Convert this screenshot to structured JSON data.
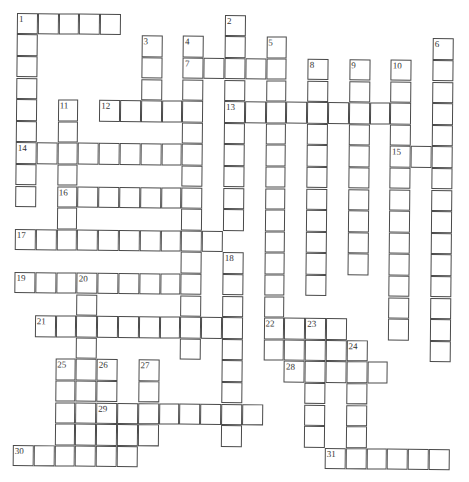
{
  "puzzle": {
    "type": "crossword",
    "grid": {
      "rows": 21,
      "cols": 22
    },
    "across": [
      {
        "number": "1",
        "row": 0,
        "col": 0,
        "length": 5
      },
      {
        "number": "7",
        "row": 2,
        "col": 8,
        "length": 5
      },
      {
        "number": "12",
        "row": 4,
        "col": 4,
        "length": 5
      },
      {
        "number": "13",
        "row": 4,
        "col": 10,
        "length": 9
      },
      {
        "number": "14",
        "row": 6,
        "col": 0,
        "length": 9
      },
      {
        "number": "15",
        "row": 6,
        "col": 18,
        "length": 3
      },
      {
        "number": "16",
        "row": 8,
        "col": 2,
        "length": 7
      },
      {
        "number": "17",
        "row": 10,
        "col": 0,
        "length": 10
      },
      {
        "number": "19",
        "row": 12,
        "col": 0,
        "length": 9
      },
      {
        "number": "21",
        "row": 14,
        "col": 1,
        "length": 10
      },
      {
        "number": "22",
        "row": 14,
        "col": 12,
        "length": 4
      },
      {
        "number": "",
        "row": 15,
        "col": 12,
        "length": 5
      },
      {
        "number": "28",
        "row": 16,
        "col": 13,
        "length": 5
      },
      {
        "number": "29",
        "row": 18,
        "col": 4,
        "length": 8
      },
      {
        "number": "",
        "row": 19,
        "col": 4,
        "length": 3
      },
      {
        "number": "30",
        "row": 20,
        "col": 0,
        "length": 6
      },
      {
        "number": "31",
        "row": 20,
        "col": 15,
        "length": 6
      }
    ],
    "down": [
      {
        "number": "1",
        "row": 0,
        "col": 0,
        "length": 9
      },
      {
        "number": "2",
        "row": 0,
        "col": 10,
        "length": 10
      },
      {
        "number": "3",
        "row": 1,
        "col": 6,
        "length": 4
      },
      {
        "number": "4",
        "row": 1,
        "col": 8,
        "length": 15
      },
      {
        "number": "5",
        "row": 1,
        "col": 12,
        "length": 15
      },
      {
        "number": "6",
        "row": 1,
        "col": 20,
        "length": 15
      },
      {
        "number": "8",
        "row": 2,
        "col": 14,
        "length": 11
      },
      {
        "number": "9",
        "row": 2,
        "col": 16,
        "length": 10
      },
      {
        "number": "10",
        "row": 2,
        "col": 18,
        "length": 13
      },
      {
        "number": "11",
        "row": 4,
        "col": 2,
        "length": 7
      },
      {
        "number": "18",
        "row": 11,
        "col": 10,
        "length": 9
      },
      {
        "number": "20",
        "row": 12,
        "col": 3,
        "length": 9
      },
      {
        "number": "23",
        "row": 14,
        "col": 14,
        "length": 6
      },
      {
        "number": "24",
        "row": 15,
        "col": 16,
        "length": 6
      },
      {
        "number": "25",
        "row": 16,
        "col": 2,
        "length": 5
      },
      {
        "number": "26",
        "row": 16,
        "col": 4,
        "length": 5
      },
      {
        "number": "27",
        "row": 16,
        "col": 6,
        "length": 4
      }
    ]
  },
  "colors": {
    "background": "#ffffff",
    "grid_line": "#4a4a4a",
    "number_text": "#333333"
  }
}
